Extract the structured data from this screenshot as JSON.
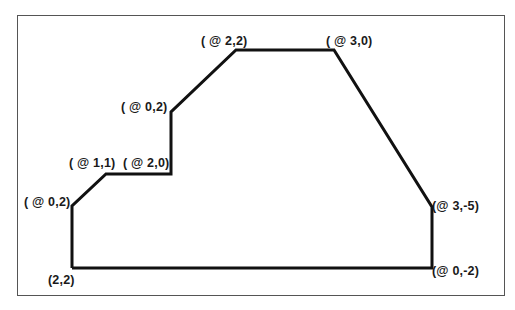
{
  "diagram": {
    "type": "polyline-coordinate-entry",
    "frame": true,
    "line_color": "#111111",
    "start_point": "(2,2)",
    "labels": [
      {
        "id": "start",
        "text": "(2,2)",
        "x": 48,
        "y": 273
      },
      {
        "id": "p1",
        "text": "( @ 0,2)",
        "x": 24,
        "y": 195
      },
      {
        "id": "p2",
        "text": "( @ 1,1)",
        "x": 69,
        "y": 156
      },
      {
        "id": "p3",
        "text": "( @ 2,0)",
        "x": 123,
        "y": 156
      },
      {
        "id": "p4",
        "text": "( @ 0,2)",
        "x": 121,
        "y": 100
      },
      {
        "id": "p5",
        "text": "( @ 2,2)",
        "x": 201,
        "y": 34
      },
      {
        "id": "p6",
        "text": "( @ 3,0)",
        "x": 326,
        "y": 34
      },
      {
        "id": "p7",
        "text": "(@ 3,-5)",
        "x": 432,
        "y": 199
      },
      {
        "id": "p8",
        "text": "(@ 0,-2)",
        "x": 432,
        "y": 264
      }
    ],
    "vertices": [
      [
        72,
        268
      ],
      [
        72,
        206
      ],
      [
        106,
        174
      ],
      [
        171,
        174
      ],
      [
        171,
        112
      ],
      [
        236,
        50
      ],
      [
        334,
        50
      ],
      [
        432,
        207
      ],
      [
        432,
        268
      ],
      [
        72,
        268
      ]
    ]
  }
}
